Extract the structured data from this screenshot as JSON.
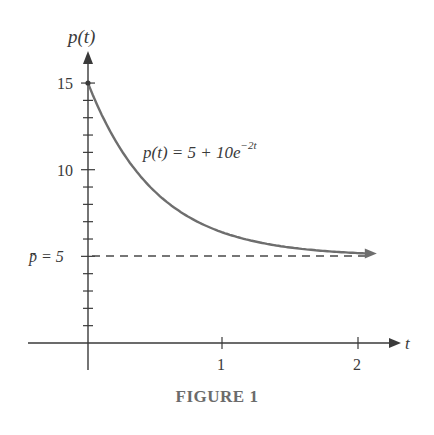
{
  "chart_data": {
    "type": "line",
    "title": "",
    "caption": "FIGURE 1",
    "xlabel": "t",
    "ylabel": "p(t)",
    "xlim": [
      -0.45,
      2.2
    ],
    "ylim": [
      -1,
      17
    ],
    "x_ticks": [
      1,
      2
    ],
    "x_tick_labels": [
      "1",
      "2"
    ],
    "y_ticks": [
      5,
      10,
      15
    ],
    "y_tick_labels": [
      "p̄ = 5",
      "10",
      "15"
    ],
    "y_minor_ticks": [
      1,
      2,
      3,
      4,
      5,
      6,
      7,
      8,
      9,
      10,
      11,
      12,
      13,
      14,
      15
    ],
    "grid": false,
    "legend": null,
    "series": [
      {
        "name": "p(t) = 5 + 10e^{-2t}",
        "formula": "5 + 10*exp(-2*t)",
        "x": [
          0,
          0.25,
          0.5,
          0.75,
          1.0,
          1.25,
          1.5,
          1.75,
          2.0
        ],
        "values": [
          15,
          11.07,
          8.68,
          7.23,
          6.35,
          5.82,
          5.5,
          5.3,
          5.18
        ],
        "color": "#6e6e6e",
        "style": "solid"
      },
      {
        "name": "equilibrium p̄ = 5",
        "x": [
          0,
          2.1
        ],
        "values": [
          5,
          5
        ],
        "color": "#4a4a4a",
        "style": "dashed"
      }
    ],
    "annotations": [
      {
        "text": "p(t) = 5 + 10e",
        "superscript": "−2t",
        "x": 0.45,
        "y": 11.5
      }
    ],
    "colors": {
      "curve": "#6e6e6e",
      "axes": "#3a3a3a",
      "caption": "#6b6b6b"
    }
  },
  "labels": {
    "y_axis": "p(t)",
    "x_axis": "t",
    "y15": "15",
    "y10": "10",
    "y5": "p̄ = 5",
    "x1": "1",
    "x2": "2",
    "curve_label_main": "p(t) = 5 + 10e",
    "curve_label_sup": "−2t",
    "caption": "FIGURE 1"
  }
}
